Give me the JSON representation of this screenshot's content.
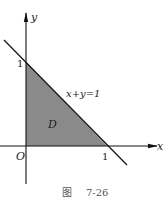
{
  "figure": {
    "caption_prefix": "图",
    "caption_number": "7-26",
    "axes": {
      "x_label": "x",
      "y_label": "y",
      "origin_label": "O",
      "x_tick_label": "1",
      "y_tick_label": "1"
    },
    "region": {
      "label": "D",
      "fill_color": "#8a8a8a",
      "vertices": [
        [
          0,
          0
        ],
        [
          1,
          0
        ],
        [
          0,
          1
        ]
      ]
    },
    "line": {
      "equation": "x+y=1",
      "color": "#111111"
    }
  }
}
